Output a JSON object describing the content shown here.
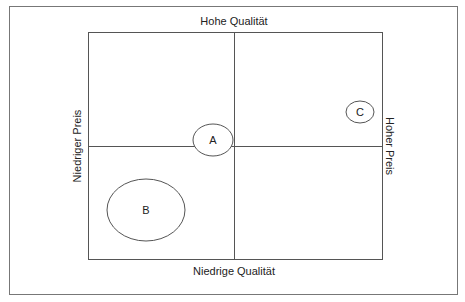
{
  "diagram": {
    "type": "positioning-map",
    "axes": {
      "top": "Hohe Qualität",
      "bottom": "Niedrige Qualität",
      "left": "Niedriger Preis",
      "right": "Hoher Preis"
    },
    "bubbles": [
      {
        "label": "A",
        "cx": 213,
        "cy": 141,
        "rx": 20,
        "ry": 16
      },
      {
        "label": "B",
        "cx": 146,
        "cy": 210,
        "rx": 39,
        "ry": 31
      },
      {
        "label": "C",
        "cx": 360,
        "cy": 112,
        "rx": 14,
        "ry": 11
      }
    ],
    "colors": {
      "line": "#555555",
      "text": "#222222",
      "background": "#ffffff"
    }
  }
}
